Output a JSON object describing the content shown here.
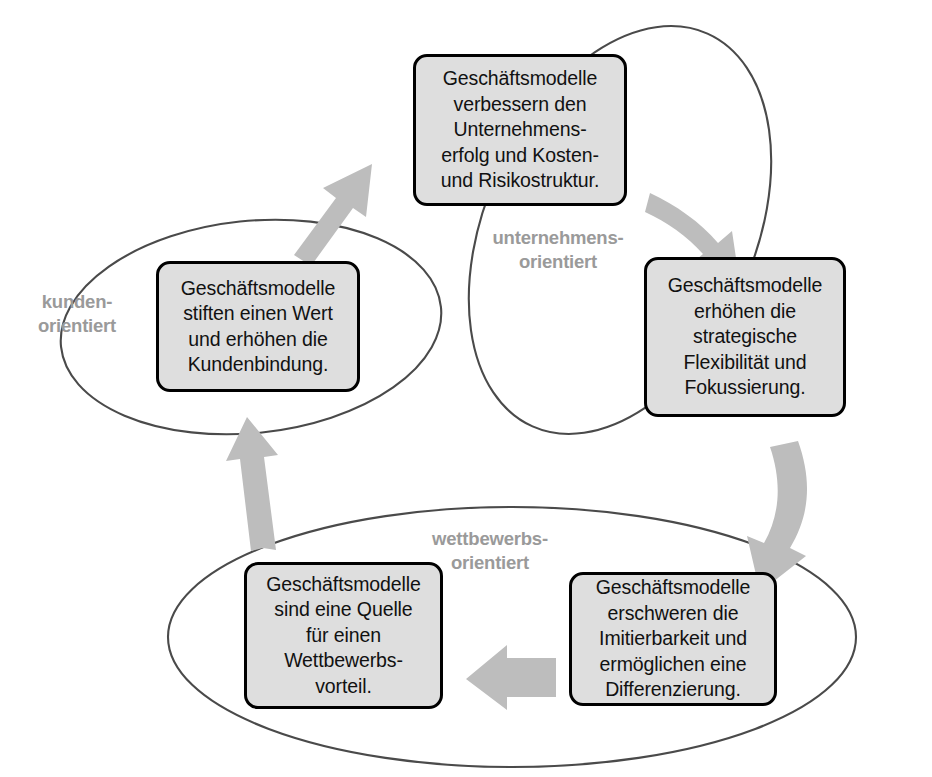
{
  "diagram": {
    "colors": {
      "box_fill": "#dedede",
      "box_border": "#000000",
      "ellipse_stroke": "#4a4a4a",
      "arrow_fill": "#bdbdbd",
      "label_text": "#9a9a9a",
      "body_text": "#111111",
      "background": "#ffffff"
    },
    "groups": [
      {
        "id": "kunden",
        "label": "kunden-\norientiert",
        "shape": "ellipse",
        "orientation": "slightly-tilted"
      },
      {
        "id": "unternehmens",
        "label": "unternehmens-\norientiert",
        "shape": "ellipse",
        "orientation": "tilted-clockwise"
      },
      {
        "id": "wettbewerbs",
        "label": "wettbewerbs-\norientiert",
        "shape": "ellipse",
        "orientation": "horizontal"
      }
    ],
    "nodes": [
      {
        "id": "top",
        "group": "unternehmens",
        "text": "Geschäftsmodelle\nverbessern den\nUnternehmens-\nerfolg und Kosten-\nund Risikostruktur."
      },
      {
        "id": "right",
        "group": "unternehmens",
        "text": "Geschäftsmodelle\nerhöhen die\nstrategische\nFlexibilität und\nFokussierung."
      },
      {
        "id": "bottom-right",
        "group": "wettbewerbs",
        "text": "Geschäftsmodelle\nerschweren die\nImitierbarkeit und\nermöglichen eine\nDifferenzierung."
      },
      {
        "id": "bottom-left",
        "group": "wettbewerbs",
        "text": "Geschäftsmodelle\nsind eine Quelle\nfür einen\nWettbewerbs-\nvorteil."
      },
      {
        "id": "left",
        "group": "kunden",
        "text": "Geschäftsmodelle\nstiften einen Wert\nund erhöhen die\nKundenbindung."
      }
    ],
    "arrows": [
      {
        "id": "left-to-top",
        "from": "left",
        "to": "top",
        "direction": "up-right"
      },
      {
        "id": "top-to-right",
        "from": "top",
        "to": "right",
        "direction": "down-right"
      },
      {
        "id": "right-to-bottom-right",
        "from": "right",
        "to": "bottom-right",
        "direction": "down"
      },
      {
        "id": "bottom-right-to-bottom-left",
        "from": "bottom-right",
        "to": "bottom-left",
        "direction": "left"
      },
      {
        "id": "bottom-left-to-left",
        "from": "bottom-left",
        "to": "left",
        "direction": "up"
      }
    ]
  }
}
